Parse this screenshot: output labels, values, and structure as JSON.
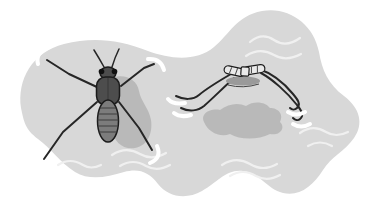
{
  "figure": {
    "views": [
      {
        "name": "top-view"
      },
      {
        "name": "side-view"
      }
    ]
  },
  "colors": {
    "background": "#ffffff",
    "water": "#d8d8d8",
    "ripple": "#f0f0f0",
    "shadow": "#b2b2b2",
    "body_dark": "#4d4d4d",
    "abdomen": "#7c7c7c",
    "outline": "#1b1b1b",
    "leg": "#262626",
    "dimple": "#ffffff",
    "side_body": "#e9e9e9",
    "side_body_shade": "#9a9a9a",
    "stripe": "#3c3c3c"
  }
}
